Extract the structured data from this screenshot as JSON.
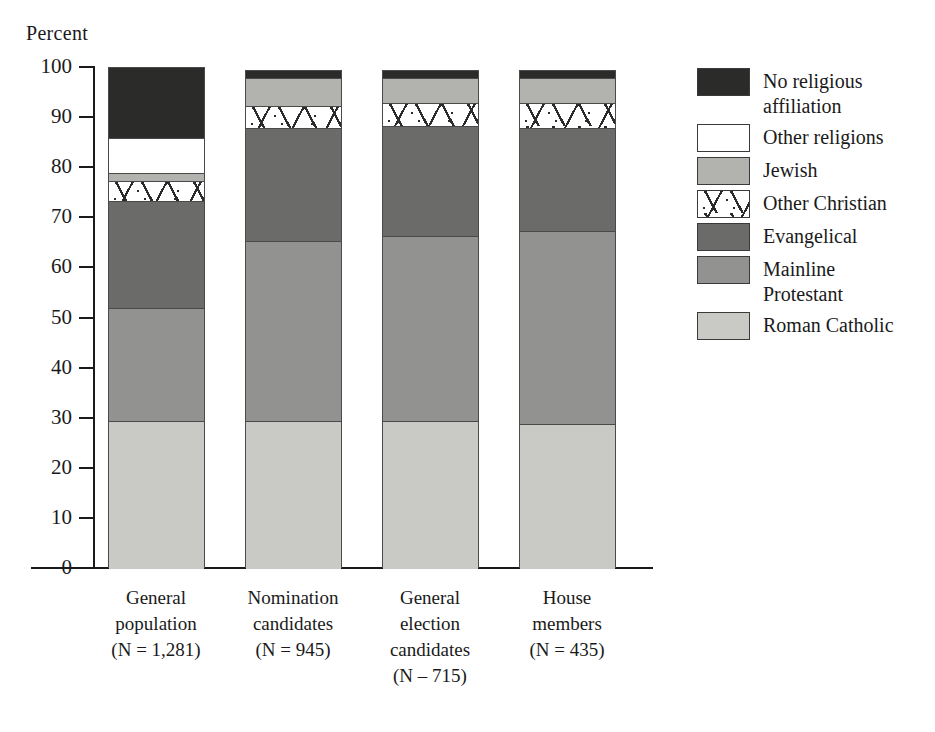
{
  "chart_data": {
    "type": "bar",
    "subtype": "stacked-bar-100",
    "title": "",
    "ylabel": "Percent",
    "xlabel": "",
    "ylim": [
      0,
      100
    ],
    "yticks": [
      0,
      10,
      20,
      30,
      40,
      50,
      60,
      70,
      80,
      90,
      100
    ],
    "grid": false,
    "legend_position": "right",
    "categories": [
      "General population (N = 1,281)",
      "Nomination candidates (N = 945)",
      "General election candidates (N – 715)",
      "House members (N = 435)"
    ],
    "series": [
      {
        "name": "Roman Catholic",
        "values": [
          29.5,
          29.5,
          29.5,
          29.0
        ]
      },
      {
        "name": "Mainline Protestant",
        "values": [
          22.5,
          36.5,
          37.0,
          38.5
        ]
      },
      {
        "name": "Evangelical",
        "values": [
          21.5,
          22.5,
          22.0,
          20.5
        ]
      },
      {
        "name": "Other Christian",
        "values": [
          4.0,
          4.5,
          4.5,
          5.0
        ]
      },
      {
        "name": "Jewish",
        "values": [
          1.5,
          5.5,
          5.0,
          5.0
        ]
      },
      {
        "name": "Other religions",
        "values": [
          7.0,
          0.0,
          0.0,
          0.0
        ]
      },
      {
        "name": "No religious affiliation",
        "values": [
          14.0,
          1.5,
          1.5,
          1.5
        ]
      }
    ]
  },
  "axis": {
    "y_title": "Percent",
    "ticks": [
      "100",
      "90",
      "80",
      "70",
      "60",
      "50",
      "40",
      "30",
      "20",
      "10",
      "0"
    ]
  },
  "bars": [
    {
      "id": "general-population",
      "label_lines": [
        "General",
        "population",
        "(N = 1,281)"
      ],
      "segments": [
        {
          "key": "no-affiliation",
          "top": 100.0,
          "bottom": 86.0
        },
        {
          "key": "other-religions",
          "top": 86.0,
          "bottom": 79.0
        },
        {
          "key": "jewish",
          "top": 79.0,
          "bottom": 77.5
        },
        {
          "key": "other-christian",
          "top": 77.5,
          "bottom": 73.5
        },
        {
          "key": "evangelical",
          "top": 73.5,
          "bottom": 52.0
        },
        {
          "key": "mainline-protestant",
          "top": 52.0,
          "bottom": 29.5
        },
        {
          "key": "roman-catholic",
          "top": 29.5,
          "bottom": 0.0
        }
      ]
    },
    {
      "id": "nomination-candidates",
      "label_lines": [
        "Nomination",
        "candidates",
        "(N = 945)"
      ],
      "segments": [
        {
          "key": "no-affiliation",
          "top": 99.5,
          "bottom": 98.0
        },
        {
          "key": "jewish",
          "top": 98.0,
          "bottom": 92.5
        },
        {
          "key": "other-christian",
          "top": 92.5,
          "bottom": 88.0
        },
        {
          "key": "evangelical",
          "top": 88.0,
          "bottom": 65.5
        },
        {
          "key": "mainline-protestant",
          "top": 65.5,
          "bottom": 29.5
        },
        {
          "key": "roman-catholic",
          "top": 29.5,
          "bottom": 0.0
        }
      ]
    },
    {
      "id": "general-election-candidates",
      "label_lines": [
        "General",
        "election",
        "candidates",
        "(N – 715)"
      ],
      "segments": [
        {
          "key": "no-affiliation",
          "top": 99.5,
          "bottom": 98.0
        },
        {
          "key": "jewish",
          "top": 98.0,
          "bottom": 93.0
        },
        {
          "key": "other-christian",
          "top": 93.0,
          "bottom": 88.5
        },
        {
          "key": "evangelical",
          "top": 88.5,
          "bottom": 66.5
        },
        {
          "key": "mainline-protestant",
          "top": 66.5,
          "bottom": 29.5
        },
        {
          "key": "roman-catholic",
          "top": 29.5,
          "bottom": 0.0
        }
      ]
    },
    {
      "id": "house-members",
      "label_lines": [
        "House",
        "members",
        "(N = 435)"
      ],
      "segments": [
        {
          "key": "no-affiliation",
          "top": 99.5,
          "bottom": 98.0
        },
        {
          "key": "jewish",
          "top": 98.0,
          "bottom": 93.0
        },
        {
          "key": "other-christian",
          "top": 93.0,
          "bottom": 88.0
        },
        {
          "key": "evangelical",
          "top": 88.0,
          "bottom": 67.5
        },
        {
          "key": "mainline-protestant",
          "top": 67.5,
          "bottom": 29.0
        },
        {
          "key": "roman-catholic",
          "top": 29.0,
          "bottom": 0.0
        }
      ]
    }
  ],
  "legend": {
    "items": [
      {
        "key": "no-affiliation",
        "label": "No religious\naffiliation",
        "color": "#2b2b29",
        "pattern": "solid"
      },
      {
        "key": "other-religions",
        "label": "Other religions",
        "color": "#ffffff",
        "pattern": "solid"
      },
      {
        "key": "jewish",
        "label": "Jewish",
        "color": "#b2b2af",
        "pattern": "solid"
      },
      {
        "key": "other-christian",
        "label": "Other Christian",
        "color": "#ffffff",
        "pattern": "hatch"
      },
      {
        "key": "evangelical",
        "label": "Evangelical",
        "color": "#6b6b69",
        "pattern": "solid"
      },
      {
        "key": "mainline-protestant",
        "label": "Mainline\nProtestant",
        "color": "#929290",
        "pattern": "solid"
      },
      {
        "key": "roman-catholic",
        "label": "Roman Catholic",
        "color": "#c9c9c6",
        "pattern": "solid"
      }
    ]
  }
}
